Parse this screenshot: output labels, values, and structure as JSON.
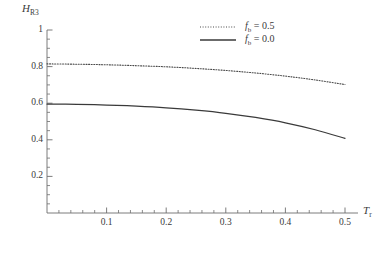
{
  "chart_data": {
    "type": "line",
    "title": "",
    "xlabel": "T_r",
    "ylabel": "H_R3",
    "xlabel_main": "T",
    "xlabel_sub": "r",
    "ylabel_main": "H",
    "ylabel_sub": "R3",
    "xlim": [
      0,
      0.52
    ],
    "ylim": [
      0,
      1
    ],
    "grid": false,
    "legend_position": "top-right",
    "x_ticks_major": [
      0.1,
      0.2,
      0.3,
      0.4,
      0.5
    ],
    "x_tick_labels": [
      "0.1",
      "0.2",
      "0.3",
      "0.4",
      "0.5"
    ],
    "x_ticks_minor": [
      0.02,
      0.04,
      0.06,
      0.08,
      0.12,
      0.14,
      0.16,
      0.18,
      0.22,
      0.24,
      0.26,
      0.28,
      0.32,
      0.34,
      0.36,
      0.38,
      0.42,
      0.44,
      0.46,
      0.48
    ],
    "y_ticks_major": [
      0.2,
      0.4,
      0.6,
      0.8,
      1
    ],
    "y_tick_labels": [
      "0.2",
      "0.4",
      "0.6",
      "0.8",
      "1"
    ],
    "y_ticks_minor": [
      0.05,
      0.1,
      0.15,
      0.25,
      0.3,
      0.35,
      0.45,
      0.5,
      0.55,
      0.65,
      0.7,
      0.75,
      0.85,
      0.9,
      0.95
    ],
    "series": [
      {
        "name": "fb = 0.5",
        "legend_main": "f",
        "legend_sub": "b",
        "legend_rest": " = 0.5",
        "style": "dotted",
        "color": "#4a4a4a",
        "x": [
          0.0,
          0.05,
          0.1,
          0.15,
          0.2,
          0.25,
          0.3,
          0.35,
          0.4,
          0.45,
          0.5
        ],
        "values": [
          0.815,
          0.813,
          0.81,
          0.805,
          0.799,
          0.79,
          0.779,
          0.765,
          0.748,
          0.727,
          0.702
        ]
      },
      {
        "name": "fb = 0.0",
        "legend_main": "f",
        "legend_sub": "b",
        "legend_rest": " = 0.0",
        "style": "solid",
        "color": "#3a3a3a",
        "x": [
          0.0,
          0.05,
          0.1,
          0.15,
          0.2,
          0.25,
          0.3,
          0.35,
          0.4,
          0.45,
          0.5
        ],
        "values": [
          0.595,
          0.594,
          0.59,
          0.584,
          0.575,
          0.562,
          0.545,
          0.522,
          0.493,
          0.455,
          0.408
        ]
      }
    ]
  },
  "axes": {
    "y_label_text": "H",
    "y_label_sub": "R3",
    "x_label_text": "T",
    "x_label_sub": "r"
  }
}
